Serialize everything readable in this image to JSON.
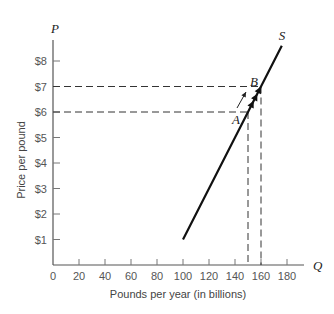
{
  "chart_data": {
    "type": "line",
    "title": "",
    "xlabel": "Pounds per year (in billions)",
    "ylabel": "Price per pound",
    "x_axis_symbol": "Q",
    "y_axis_symbol": "P",
    "xlim": [
      0,
      190
    ],
    "ylim": [
      0,
      8.5
    ],
    "x_ticks": [
      0,
      20,
      40,
      60,
      80,
      100,
      120,
      140,
      160,
      180
    ],
    "x_tick_labels": [
      "0",
      "20",
      "40",
      "60",
      "80",
      "100",
      "120",
      "140",
      "160",
      "180"
    ],
    "y_ticks": [
      1,
      2,
      3,
      4,
      5,
      6,
      7,
      8
    ],
    "y_tick_labels": [
      "$1",
      "$2",
      "$3",
      "$4",
      "$5",
      "$6",
      "$7",
      "$8"
    ],
    "grid": false,
    "series": [
      {
        "name": "S",
        "x": [
          100,
          150,
          160,
          176
        ],
        "y": [
          1,
          6,
          7,
          8.6
        ]
      }
    ],
    "points": [
      {
        "label": "A",
        "x": 150,
        "y": 6
      },
      {
        "label": "B",
        "x": 160,
        "y": 7
      }
    ],
    "annotations": [
      {
        "type": "dashed-guide",
        "from": "A",
        "note": "dashed lines to P=$6 and Q=150"
      },
      {
        "type": "dashed-guide",
        "from": "B",
        "note": "dashed lines to P=$7 and Q=160"
      },
      {
        "type": "arrow",
        "note": "movement along supply curve from A to B"
      }
    ]
  },
  "labels": {
    "S": "S",
    "A": "A",
    "B": "B",
    "P": "P",
    "Q": "Q"
  }
}
